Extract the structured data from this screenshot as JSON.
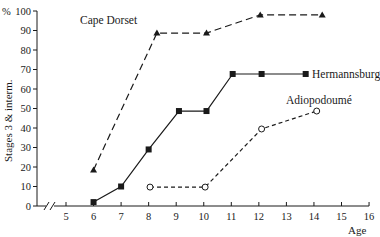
{
  "chart_data": {
    "type": "line",
    "title": "",
    "xlabel": "Age",
    "ylabel": "Stages 3 & interm.",
    "y_unit_label": "%",
    "xlim": [
      4,
      16
    ],
    "ylim": [
      0,
      100
    ],
    "x_ticks": [
      5,
      6,
      7,
      8,
      9,
      10,
      11,
      12,
      13,
      14,
      15,
      16
    ],
    "y_ticks": [
      0,
      10,
      20,
      30,
      40,
      50,
      60,
      70,
      80,
      90,
      100
    ],
    "x_axis_break": true,
    "grid": false,
    "legend": "inline labels near series",
    "series": [
      {
        "name": "Cape Dorset",
        "marker": "filled-triangle",
        "line": "long-dash",
        "x": [
          6,
          8.3,
          10.1,
          12.05,
          14.3
        ],
        "y": [
          18.5,
          88.7,
          88.7,
          98,
          98
        ]
      },
      {
        "name": "Hermannsburg",
        "marker": "filled-square",
        "line": "solid",
        "x": [
          6,
          7,
          8,
          9.1,
          10.1,
          11.05,
          12.1,
          13.7
        ],
        "y": [
          2,
          10,
          29,
          48.7,
          48.7,
          67.7,
          67.7,
          67.7
        ]
      },
      {
        "name": "Adiopodoumé",
        "marker": "open-circle",
        "line": "short-dash",
        "x": [
          8.05,
          10.05,
          12.1,
          14.1
        ],
        "y": [
          9.7,
          9.7,
          39.5,
          48.7
        ]
      }
    ]
  },
  "labels": {
    "cape_dorset": "Cape Dorset",
    "hermannsburg": "Hermannsburg",
    "adiopodoume": "Adiopodoumé",
    "x_axis_title": "Age",
    "y_axis_title": "Stages 3 & interm.",
    "y_unit": "%"
  }
}
